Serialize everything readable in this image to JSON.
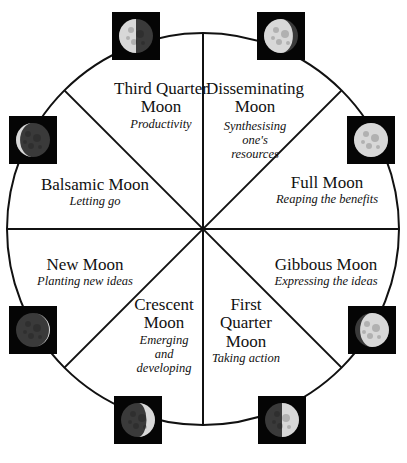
{
  "phases": [
    {
      "id": "third-quarter",
      "name": "Third Quarter Moon",
      "name_lines": [
        "Third Quarter",
        "Moon"
      ],
      "meaning": "Productivity",
      "meaning_lines": [
        "Productivity"
      ],
      "illumination": 0.5,
      "lit_side": "left"
    },
    {
      "id": "disseminating",
      "name": "Disseminating Moon",
      "name_lines": [
        "Disseminating",
        "Moon"
      ],
      "meaning": "Synthesising one's resources",
      "meaning_lines": [
        "Synthesising",
        "one's",
        "resources"
      ],
      "illumination": 0.85,
      "lit_side": "left"
    },
    {
      "id": "full",
      "name": "Full Moon",
      "name_lines": [
        "Full Moon"
      ],
      "meaning": "Reaping the benefits",
      "meaning_lines": [
        "Reaping the benefits"
      ],
      "illumination": 1.0,
      "lit_side": "both"
    },
    {
      "id": "gibbous",
      "name": "Gibbous Moon",
      "name_lines": [
        "Gibbous Moon"
      ],
      "meaning": "Expressing the ideas",
      "meaning_lines": [
        "Expressing the ideas"
      ],
      "illumination": 0.85,
      "lit_side": "right"
    },
    {
      "id": "first-quarter",
      "name": "First Quarter Moon",
      "name_lines": [
        "First",
        "Quarter",
        "Moon"
      ],
      "meaning": "Taking action",
      "meaning_lines": [
        "Taking action"
      ],
      "illumination": 0.5,
      "lit_side": "right"
    },
    {
      "id": "crescent",
      "name": "Crescent Moon",
      "name_lines": [
        "Crescent",
        "Moon"
      ],
      "meaning": "Emerging and developing",
      "meaning_lines": [
        "Emerging",
        "and",
        "developing"
      ],
      "illumination": 0.25,
      "lit_side": "right"
    },
    {
      "id": "new",
      "name": "New Moon",
      "name_lines": [
        "New Moon"
      ],
      "meaning": "Planting new ideas",
      "meaning_lines": [
        "Planting new ideas"
      ],
      "illumination": 0.03,
      "lit_side": "right"
    },
    {
      "id": "balsamic",
      "name": "Balsamic Moon",
      "name_lines": [
        "Balsamic Moon"
      ],
      "meaning": "Letting go",
      "meaning_lines": [
        "Letting go"
      ],
      "illumination": 0.12,
      "lit_side": "left"
    }
  ],
  "colors": {
    "line": "#111111",
    "moon_bg": "#050505",
    "moon_lit": "#d8d8d8",
    "moon_dark": "#3a3a3a"
  }
}
